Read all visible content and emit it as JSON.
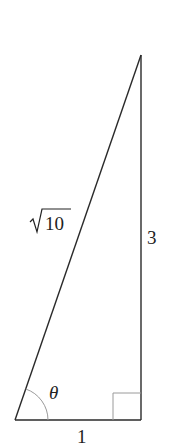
{
  "diagram": {
    "type": "right-triangle",
    "labels": {
      "hypotenuse": "10",
      "hypotenuse_prefix": "√",
      "opposite": "3",
      "adjacent": "1",
      "angle": "θ"
    },
    "colors": {
      "stroke": "#2a2a2a",
      "arc": "#9a9a9a",
      "right_angle_marker": "#9a9a9a",
      "background": "#ffffff"
    }
  }
}
